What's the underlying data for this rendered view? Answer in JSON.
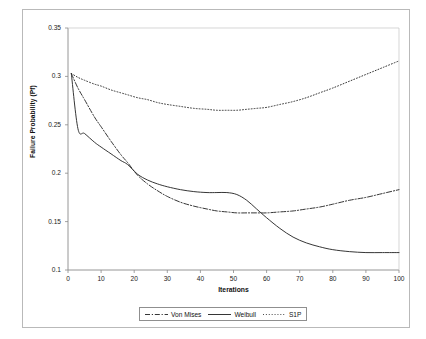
{
  "chart_data": {
    "type": "line",
    "title": "",
    "xlabel": "Iterations",
    "ylabel": "Failure Probability (Pf)",
    "xlim": [
      0,
      100
    ],
    "ylim": [
      0.1,
      0.35
    ],
    "xticks": [
      0,
      10,
      20,
      30,
      40,
      50,
      60,
      70,
      80,
      90,
      100
    ],
    "yticks": [
      0.1,
      0.15,
      0.2,
      0.25,
      0.3,
      0.35
    ],
    "xtick_labels": [
      "0",
      "10",
      "20",
      "30",
      "40",
      "50",
      "60",
      "70",
      "80",
      "90",
      "100"
    ],
    "ytick_labels": [
      "0.1",
      "0.15",
      "0.2",
      "0.25",
      "0.3",
      "0.35"
    ],
    "grid": false,
    "legend_position": "bottom",
    "x": [
      1,
      3,
      5,
      8,
      10,
      13,
      16,
      18,
      21,
      24,
      27,
      30,
      34,
      38,
      42,
      45,
      48,
      51,
      54,
      57,
      60,
      64,
      68,
      72,
      76,
      80,
      85,
      90,
      95,
      100
    ],
    "series": [
      {
        "name": "Von Mises",
        "linestyle": "dash-dot",
        "color": "#2b2b2b",
        "values": [
          0.303,
          0.288,
          0.276,
          0.258,
          0.248,
          0.233,
          0.219,
          0.211,
          0.198,
          0.189,
          0.182,
          0.176,
          0.17,
          0.166,
          0.163,
          0.161,
          0.16,
          0.159,
          0.159,
          0.159,
          0.159,
          0.16,
          0.161,
          0.163,
          0.165,
          0.168,
          0.172,
          0.175,
          0.179,
          0.183
        ]
      },
      {
        "name": "Weibull",
        "linestyle": "solid",
        "color": "#2b2b2b",
        "values": [
          0.303,
          0.246,
          0.241,
          0.232,
          0.227,
          0.22,
          0.213,
          0.209,
          0.199,
          0.193,
          0.189,
          0.186,
          0.183,
          0.181,
          0.18,
          0.18,
          0.18,
          0.178,
          0.172,
          0.163,
          0.154,
          0.143,
          0.134,
          0.128,
          0.124,
          0.121,
          0.119,
          0.118,
          0.118,
          0.118
        ]
      },
      {
        "name": "S1P",
        "linestyle": "dotted",
        "color": "#2b2b2b",
        "values": [
          0.303,
          0.299,
          0.296,
          0.292,
          0.29,
          0.286,
          0.283,
          0.281,
          0.278,
          0.276,
          0.273,
          0.271,
          0.269,
          0.267,
          0.266,
          0.265,
          0.265,
          0.265,
          0.266,
          0.267,
          0.268,
          0.271,
          0.274,
          0.278,
          0.283,
          0.288,
          0.295,
          0.302,
          0.309,
          0.316
        ]
      }
    ]
  },
  "legend": {
    "items": [
      {
        "label": "Von Mises",
        "style": "dash-dot"
      },
      {
        "label": "Weibull",
        "style": "solid"
      },
      {
        "label": "S1P",
        "style": "dotted"
      }
    ]
  }
}
